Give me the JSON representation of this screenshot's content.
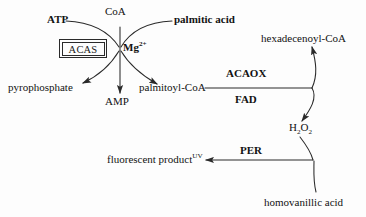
{
  "diagram": {
    "background_color": "#fdfdfd",
    "stroke_color": "#2a2a2a",
    "text_color": "#121212",
    "substrates": {
      "atp": "ATP",
      "coa": "CoA",
      "palmitic_acid": "palmitic acid",
      "homovanillic_acid": "homovanillic acid"
    },
    "cofactors": {
      "magnesium": "Mg",
      "magnesium_charge": "2+",
      "fad": "FAD"
    },
    "enzymes": {
      "acas": "ACAS",
      "acaox": "ACAOX",
      "per": "PER"
    },
    "products": {
      "pyrophosphate": "pyrophosphate",
      "amp": "AMP",
      "palmitoyl_coa": "palmitoyl-CoA",
      "hexadecenoyl_coa": "hexadecenoyl-CoA",
      "hydrogen_peroxide_h": "H",
      "hydrogen_peroxide_h_sub": "2",
      "hydrogen_peroxide_o": "O",
      "hydrogen_peroxide_o_sub": "2",
      "fluorescent_product": "fluorescent product",
      "fluorescent_product_sup": "UV"
    }
  }
}
